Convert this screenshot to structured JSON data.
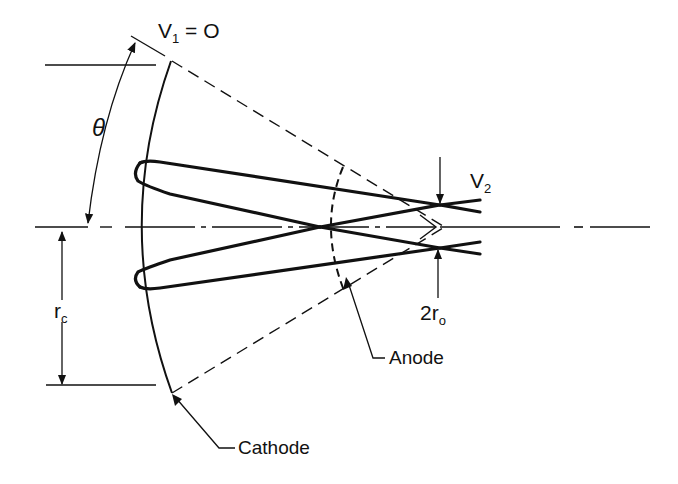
{
  "diagram": {
    "type": "electron-gun-geometry",
    "labels": {
      "v1": {
        "base": "V",
        "sub": "1",
        "rest": " = O"
      },
      "v2": {
        "base": "V",
        "sub": "2"
      },
      "theta": "θ",
      "rc": {
        "base": "r",
        "sub": "c"
      },
      "ro": {
        "prefix": "2",
        "base": "r",
        "sub": "o"
      },
      "anode": "Anode",
      "cathode": "Cathode"
    },
    "colors": {
      "ink": "#111111",
      "background": "#ffffff"
    }
  }
}
